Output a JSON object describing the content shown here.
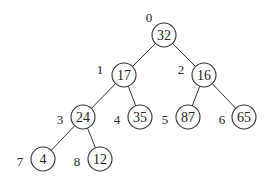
{
  "diagram": {
    "type": "binary-heap-tree",
    "node_radius": 12,
    "nodes": [
      {
        "index": "0",
        "value": "32",
        "cx": 164,
        "cy": 35,
        "lx": 149,
        "ly": 17
      },
      {
        "index": "1",
        "value": "17",
        "cx": 124,
        "cy": 75,
        "lx": 100,
        "ly": 69
      },
      {
        "index": "2",
        "value": "16",
        "cx": 204,
        "cy": 75,
        "lx": 181,
        "ly": 69
      },
      {
        "index": "3",
        "value": "24",
        "cx": 83,
        "cy": 117,
        "lx": 60,
        "ly": 119
      },
      {
        "index": "4",
        "value": "35",
        "cx": 140,
        "cy": 117,
        "lx": 117,
        "ly": 119
      },
      {
        "index": "5",
        "value": "87",
        "cx": 188,
        "cy": 117,
        "lx": 165,
        "ly": 119
      },
      {
        "index": "6",
        "value": "65",
        "cx": 244,
        "cy": 117,
        "lx": 222,
        "ly": 119
      },
      {
        "index": "7",
        "value": "4",
        "cx": 43,
        "cy": 159,
        "lx": 20,
        "ly": 161
      },
      {
        "index": "8",
        "value": "12",
        "cx": 100,
        "cy": 159,
        "lx": 77,
        "ly": 161
      }
    ],
    "edges": [
      [
        0,
        1
      ],
      [
        0,
        2
      ],
      [
        1,
        3
      ],
      [
        1,
        4
      ],
      [
        2,
        5
      ],
      [
        2,
        6
      ],
      [
        3,
        7
      ],
      [
        3,
        8
      ]
    ]
  }
}
